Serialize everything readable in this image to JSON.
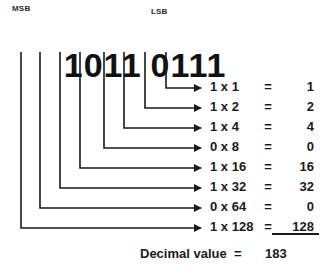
{
  "diagram": {
    "msb_label": "MSB",
    "lsb_label": "LSB",
    "binary_high_nibble": "1011",
    "binary_low_nibble": "0111",
    "bits": [
      "1",
      "0",
      "1",
      "1",
      "0",
      "1",
      "1",
      "1"
    ],
    "equations": [
      {
        "term": "1 x 1",
        "sign": "=",
        "value": "1"
      },
      {
        "term": "1 x 2",
        "sign": "=",
        "value": "2"
      },
      {
        "term": "1 x 4",
        "sign": "=",
        "value": "4"
      },
      {
        "term": "0 x 8",
        "sign": "=",
        "value": "0"
      },
      {
        "term": "1 x 16",
        "sign": "=",
        "value": "16"
      },
      {
        "term": "1 x 32",
        "sign": "=",
        "value": "32"
      },
      {
        "term": "0 x 64",
        "sign": "=",
        "value": "0"
      },
      {
        "term": "1 x 128",
        "sign": "=",
        "value": "128"
      }
    ],
    "total_label": "Decimal value",
    "total_sign": "=",
    "total_value": "183"
  },
  "colors": {
    "ink": "#1a1a1a",
    "background": "#ffffff"
  }
}
